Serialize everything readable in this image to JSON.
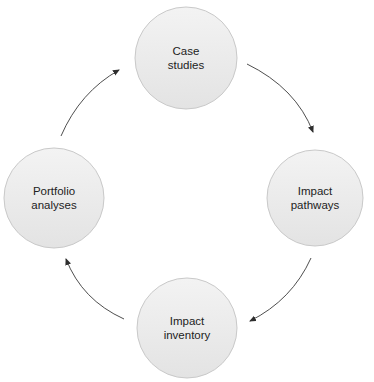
{
  "diagram": {
    "type": "cycle",
    "colors": {
      "background": "#ffffff",
      "node_fill_top": "#f2f2f2",
      "node_fill_bottom": "#e4e4e4",
      "node_stroke": "#c9c9c9",
      "arrow": "#3a3a3a",
      "text": "#222222"
    },
    "nodes": [
      {
        "id": "case-studies",
        "line1": "Case",
        "line2": "studies",
        "cx": 186,
        "cy": 58,
        "r": 51
      },
      {
        "id": "impact-pathways",
        "line1": "Impact",
        "line2": "pathways",
        "cx": 315,
        "cy": 198,
        "r": 48
      },
      {
        "id": "impact-inventory",
        "line1": "Impact",
        "line2": "inventory",
        "cx": 187,
        "cy": 328,
        "r": 50
      },
      {
        "id": "portfolio-analyses",
        "line1": "Portfolio",
        "line2": "analyses",
        "cx": 54,
        "cy": 198,
        "r": 50
      }
    ],
    "edges": [
      {
        "from": "case-studies",
        "to": "impact-pathways"
      },
      {
        "from": "impact-pathways",
        "to": "impact-inventory"
      },
      {
        "from": "impact-inventory",
        "to": "portfolio-analyses"
      },
      {
        "from": "portfolio-analyses",
        "to": "case-studies"
      }
    ]
  }
}
